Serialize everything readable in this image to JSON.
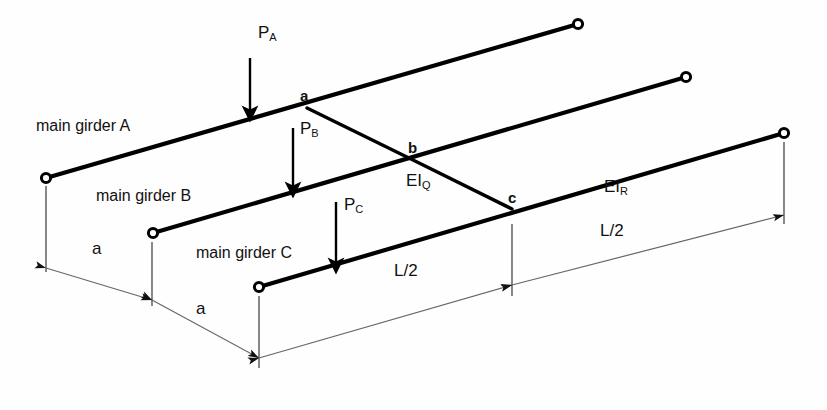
{
  "figure": {
    "type": "structural-engineering-diagram",
    "background_color": "#ffffff",
    "line_color": "#000000",
    "dimension_line_color": "#555555"
  },
  "girders": [
    {
      "id": "A",
      "label": "main girder A",
      "label_x": 36,
      "label_y": 118,
      "start": {
        "x": 46,
        "y": 178
      },
      "end": {
        "x": 578,
        "y": 24
      },
      "support_start": "pin-circle",
      "support_end": "pin-circle"
    },
    {
      "id": "B",
      "label": "main girder B",
      "label_x": 96,
      "label_y": 188,
      "start": {
        "x": 153,
        "y": 233
      },
      "end": {
        "x": 686,
        "y": 77
      },
      "support_start": "pin-circle",
      "support_end": "pin-circle"
    },
    {
      "id": "C",
      "label": "main girder C",
      "label_x": 196,
      "label_y": 245,
      "start": {
        "x": 259,
        "y": 287
      },
      "end": {
        "x": 784,
        "y": 133
      },
      "support_start": "pin-circle",
      "support_end": "pin-circle"
    }
  ],
  "cross_girder": {
    "name": "zigzag cross girder",
    "points": [
      {
        "label": "a",
        "x": 307,
        "y": 108,
        "on_girder": "A",
        "label_x": 300,
        "label_y": 88
      },
      {
        "label": "b",
        "x": 413,
        "y": 160,
        "on_girder": "B",
        "label_x": 408,
        "label_y": 140
      },
      {
        "label": "c",
        "x": 512,
        "y": 209,
        "on_girder": "C",
        "label_x": 508,
        "label_y": 190
      }
    ]
  },
  "loads": [
    {
      "name": "P_A",
      "label": "P",
      "subscript": "A",
      "x": 250,
      "y_top": 58,
      "y_bottom": 116,
      "label_x": 258,
      "label_y": 24,
      "girder": "A"
    },
    {
      "name": "P_B",
      "label": "P",
      "subscript": "B",
      "x": 293,
      "y_top": 128,
      "y_bottom": 192,
      "label_x": 300,
      "label_y": 120,
      "girder": "B"
    },
    {
      "name": "P_C",
      "label": "P",
      "subscript": "C",
      "x": 336,
      "y_top": 202,
      "y_bottom": 268,
      "label_x": 344,
      "label_y": 196,
      "girder": "C"
    }
  ],
  "stiffness_labels": [
    {
      "name": "EI_Q",
      "label": "EI",
      "subscript": "Q",
      "x": 406,
      "y": 172
    },
    {
      "name": "EI_R",
      "label": "EI",
      "subscript": "R",
      "x": 604,
      "y": 178
    }
  ],
  "dimensions": [
    {
      "name": "a-left",
      "label": "a",
      "label_x": 92,
      "label_y": 240,
      "from": {
        "x": 46,
        "y": 268
      },
      "to": {
        "x": 152,
        "y": 300
      },
      "arrows": "both"
    },
    {
      "name": "a-right",
      "label": "a",
      "label_x": 196,
      "label_y": 300,
      "from": {
        "x": 152,
        "y": 300
      },
      "to": {
        "x": 259,
        "y": 358
      },
      "arrows": "both"
    },
    {
      "name": "L-half-left",
      "label": "L/2",
      "label_x": 394,
      "label_y": 262,
      "from": {
        "x": 259,
        "y": 358
      },
      "to": {
        "x": 512,
        "y": 285
      },
      "arrows": "both"
    },
    {
      "name": "L-half-right",
      "label": "L/2",
      "label_x": 600,
      "label_y": 222,
      "from": {
        "x": 512,
        "y": 285
      },
      "to": {
        "x": 784,
        "y": 215
      },
      "arrows": "both"
    }
  ],
  "extension_lines": [
    {
      "name": "ext-girder-A-left",
      "x1": 46,
      "y1": 186,
      "x2": 46,
      "y2": 272
    },
    {
      "name": "ext-girder-B-left",
      "x1": 152,
      "y1": 242,
      "x2": 152,
      "y2": 306
    },
    {
      "name": "ext-girder-C-left",
      "x1": 259,
      "y1": 296,
      "x2": 259,
      "y2": 368
    },
    {
      "name": "ext-point-c",
      "x1": 512,
      "y1": 224,
      "x2": 512,
      "y2": 296
    },
    {
      "name": "ext-girder-C-right",
      "x1": 784,
      "y1": 142,
      "x2": 784,
      "y2": 224
    }
  ]
}
